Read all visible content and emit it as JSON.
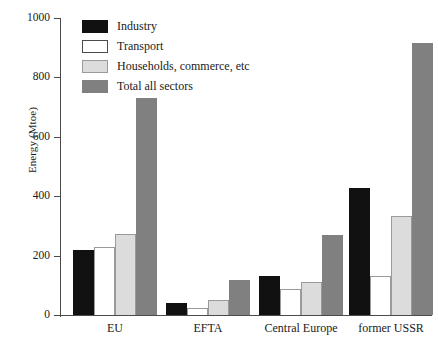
{
  "chart_data": {
    "type": "bar",
    "title": "",
    "xlabel": "",
    "ylabel": "Energy (Mtoe)",
    "ylim": [
      0,
      1000
    ],
    "yticks": [
      0,
      200,
      400,
      600,
      800,
      1000
    ],
    "grid": false,
    "legend_position": "top-left",
    "categories": [
      "EU",
      "EFTA",
      "Central Europe",
      "former USSR"
    ],
    "series": [
      {
        "name": "Industry",
        "color": "#111111",
        "values": [
          220,
          42,
          130,
          428
        ]
      },
      {
        "name": "Transport",
        "color": "#ffffff",
        "values": [
          228,
          25,
          88,
          131
        ]
      },
      {
        "name": "Households, commerce, etc",
        "color": "#dcdcdc",
        "values": [
          272,
          52,
          110,
          335
        ]
      },
      {
        "name": "Total all sectors",
        "color": "#808080",
        "values": [
          730,
          117,
          268,
          915
        ]
      }
    ]
  },
  "axis": {
    "y_title": "Energy (Mtoe)",
    "y_ticks": [
      "1000",
      "800",
      "600",
      "400",
      "200",
      "0"
    ],
    "x_labels": [
      "EU",
      "EFTA",
      "Central Europe",
      "former USSR"
    ]
  },
  "legend": {
    "items": [
      {
        "label": "Industry"
      },
      {
        "label": "Transport"
      },
      {
        "label": "Households, commerce, etc"
      },
      {
        "label": "Total all sectors"
      }
    ]
  }
}
